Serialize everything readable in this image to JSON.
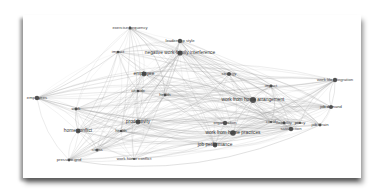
{
  "diagram": {
    "type": "keyword-cooccurrence-network",
    "edge_color": "#9a9a9a",
    "node_color": "#555555",
    "background": "#ffffff",
    "nodes": [
      {
        "id": "n1",
        "label": "exercise frequency",
        "x": 130,
        "y": 28,
        "r": 1.6
      },
      {
        "id": "n2",
        "label": "leadership style",
        "x": 180,
        "y": 41,
        "r": 2.2
      },
      {
        "id": "n3",
        "label": "negative work-family interference",
        "x": 180,
        "y": 53,
        "r": 2.6
      },
      {
        "id": "n4",
        "label": "impact",
        "x": 118,
        "y": 52,
        "r": 1.2
      },
      {
        "id": "n5",
        "label": "employee",
        "x": 144,
        "y": 74,
        "r": 2.4
      },
      {
        "id": "n6",
        "label": "attitude",
        "x": 138,
        "y": 91,
        "r": 1.2
      },
      {
        "id": "n7",
        "label": "health",
        "x": 165,
        "y": 95,
        "r": 1.4
      },
      {
        "id": "n8",
        "label": "strategy",
        "x": 229,
        "y": 74,
        "r": 2.0
      },
      {
        "id": "n9",
        "label": "impact",
        "x": 271,
        "y": 86,
        "r": 1.4
      },
      {
        "id": "n10",
        "label": "work life integration",
        "x": 335,
        "y": 80,
        "r": 2.2
      },
      {
        "id": "n11",
        "label": "employees",
        "x": 37,
        "y": 98,
        "r": 2.2
      },
      {
        "id": "n12",
        "label": "work from home arrangement",
        "x": 253,
        "y": 100,
        "r": 3.0
      },
      {
        "id": "n13",
        "label": "work",
        "x": 76,
        "y": 109,
        "r": 1.4
      },
      {
        "id": "n14",
        "label": "productivity",
        "x": 138,
        "y": 122,
        "r": 2.4
      },
      {
        "id": "n15",
        "label": "home conflict",
        "x": 78,
        "y": 131,
        "r": 2.4
      },
      {
        "id": "n16",
        "label": "health",
        "x": 121,
        "y": 131,
        "r": 1.2
      },
      {
        "id": "n17",
        "label": "organization",
        "x": 225,
        "y": 123,
        "r": 2.2
      },
      {
        "id": "n18",
        "label": "work from home practices",
        "x": 233,
        "y": 133,
        "r": 2.8
      },
      {
        "id": "n19",
        "label": "flexibility",
        "x": 284,
        "y": 123,
        "r": 1.4
      },
      {
        "id": "n20",
        "label": "satisfaction",
        "x": 291,
        "y": 129,
        "r": 2.2
      },
      {
        "id": "n21",
        "label": "job performance",
        "x": 215,
        "y": 145,
        "r": 2.4
      },
      {
        "id": "n22",
        "label": "stress",
        "x": 97,
        "y": 150,
        "r": 1.6
      },
      {
        "id": "n23",
        "label": "pressure grid",
        "x": 69,
        "y": 160,
        "r": 1.4
      },
      {
        "id": "n24",
        "label": "work home conflict",
        "x": 134,
        "y": 159,
        "r": 1.0
      },
      {
        "id": "n25",
        "label": "job demand",
        "x": 331,
        "y": 107,
        "r": 2.0
      },
      {
        "id": "n26",
        "label": "job strain",
        "x": 320,
        "y": 125,
        "r": 1.4
      },
      {
        "id": "n27",
        "label": "policy",
        "x": 300,
        "y": 123,
        "r": 1.0
      },
      {
        "id": "n28",
        "label": "covid",
        "x": 271,
        "y": 122,
        "r": 1.0
      }
    ]
  }
}
